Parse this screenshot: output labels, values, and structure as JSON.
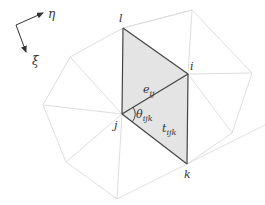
{
  "diagram": {
    "colors": {
      "mesh_edge": "#dedede",
      "highlight_edge": "#444444",
      "shaded_fill": "#e4e4e4",
      "label": "#333333"
    },
    "frame": {
      "origin": [
        16,
        25
      ],
      "eta_label": "η",
      "xi_label": "ξ"
    },
    "vertices": {
      "l": {
        "label": "l",
        "pos": [
          123,
          28
        ]
      },
      "i": {
        "label": "i",
        "pos": [
          188,
          74
        ]
      },
      "j": {
        "label": "j",
        "pos": [
          122,
          114
        ]
      },
      "k": {
        "label": "k",
        "pos": [
          187,
          164
        ]
      }
    },
    "outer_vertices": [
      [
        192,
        10
      ],
      [
        252,
        73
      ],
      [
        232,
        133
      ],
      [
        117,
        199
      ],
      [
        66,
        162
      ],
      [
        43,
        105
      ],
      [
        70,
        57
      ]
    ],
    "edge_label": {
      "base": "e",
      "sub": "ij"
    },
    "angle_label": {
      "base": "θ",
      "sub": "ijk"
    },
    "triangle_label": {
      "base": "t",
      "sub": "ijk"
    }
  }
}
